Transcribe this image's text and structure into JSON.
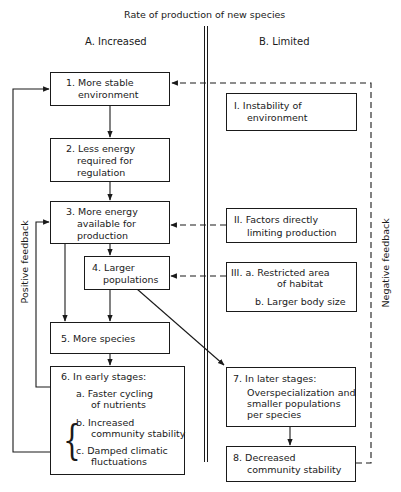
{
  "title": "Rate of production of new species",
  "columns": {
    "a": "A.  Increased",
    "b": "B. Limited"
  },
  "feedback": {
    "positive": "Positive feedback",
    "negative": "Negative feedback"
  },
  "boxes_a": {
    "b1": {
      "l1": "1. More stable",
      "l2": "environment"
    },
    "b2": {
      "l1": "2. Less energy",
      "l2": "required for",
      "l3": "regulation"
    },
    "b3": {
      "l1": "3. More energy",
      "l2": "available for",
      "l3": "production"
    },
    "b4": {
      "l1": "4. Larger",
      "l2": "populations"
    },
    "b5": {
      "l1": "5.  More species"
    },
    "b6": {
      "heading": "6.  In early stages:",
      "a1": "a.  Faster cycling",
      "a2": "of nutrients",
      "b1": "b.  Increased",
      "b2": "community stability",
      "c1": "c.  Damped climatic",
      "c2": "fluctuations"
    }
  },
  "boxes_b": {
    "bI": {
      "l1": "I. Instability of",
      "l2": "environment"
    },
    "bII": {
      "l1": "II. Factors directly",
      "l2": "limiting production"
    },
    "bIII": {
      "l1": "III.  a. Restricted area",
      "l2": "of habitat",
      "l3": "b. Larger body size"
    },
    "b7": {
      "l1": "7.  In later stages:",
      "l2": "Overspecialization and",
      "l3": "smaller populations",
      "l4": "per species"
    },
    "b8": {
      "l1": "8.  Decreased",
      "l2": "community stability"
    }
  },
  "brace_glyph": "{"
}
